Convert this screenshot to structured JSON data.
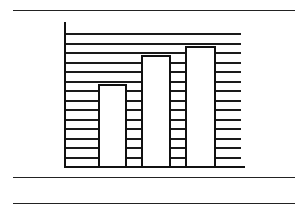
{
  "chart_data": {
    "type": "bar",
    "title": "",
    "xlabel": "",
    "ylabel": "",
    "categories": [
      "",
      "",
      ""
    ],
    "values": [
      8.6,
      11.7,
      12.6
    ],
    "ylim": [
      0,
      14
    ],
    "grid": true,
    "gridline_count": 14,
    "legend": null,
    "bar_fill": "#ffffff",
    "line_color": "#111111"
  },
  "layout": {
    "rules_y": [
      10,
      177,
      203
    ],
    "plot": {
      "axis_x": 64,
      "axis_top": 22,
      "baseline_y": 166,
      "grid_right": 241,
      "baseline_right": 245,
      "step": 9.5
    },
    "bars": [
      {
        "left": 98,
        "width": 29
      },
      {
        "left": 141,
        "width": 30
      },
      {
        "left": 185,
        "width": 31
      }
    ]
  }
}
